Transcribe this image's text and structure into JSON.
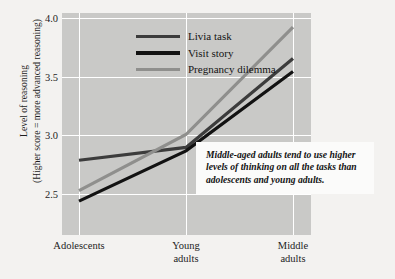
{
  "chart_data": {
    "type": "line",
    "title": "",
    "xlabel": "",
    "ylabel": "Level of reasoning",
    "ylabel_sub": "(Higher score = more advanced reasoning)",
    "categories": [
      "Adolescents",
      "Young adults",
      "Middle adults"
    ],
    "category_lines": [
      [
        "Adolescents"
      ],
      [
        "Young",
        "adults"
      ],
      [
        "Middle",
        "adults"
      ]
    ],
    "ylim": [
      2.32,
      4.22
    ],
    "yticks": [
      "2.5",
      "3.0",
      "3.5",
      "4.0"
    ],
    "ytick_values": [
      2.5,
      3.0,
      3.5,
      4.0
    ],
    "grid": "white gridlines, horizontal at each ytick and vertical at each category",
    "legend_position": "top-left inside plot area",
    "series": [
      {
        "name": "Livia task",
        "color": "#3c3c3c",
        "values": [
          2.96,
          3.07,
          3.83
        ]
      },
      {
        "name": "Visit story",
        "color": "#121212",
        "values": [
          2.61,
          3.04,
          3.72
        ]
      },
      {
        "name": "Pregnancy dilemma",
        "color": "#8f8f8d",
        "values": [
          2.7,
          3.18,
          4.1
        ]
      }
    ],
    "annotations": [
      {
        "text": "Middle-aged adults tend to use higher levels of thinking on all the tasks than adolescents and young adults.",
        "style": "italic bold serif, white box"
      }
    ]
  },
  "colors": {
    "page_background": "#f3f2f0",
    "plot_background": "#c9c9c7",
    "gridline": "#ffffff",
    "text": "#1d1d1d",
    "annotation_background": "#fbfbfa"
  }
}
